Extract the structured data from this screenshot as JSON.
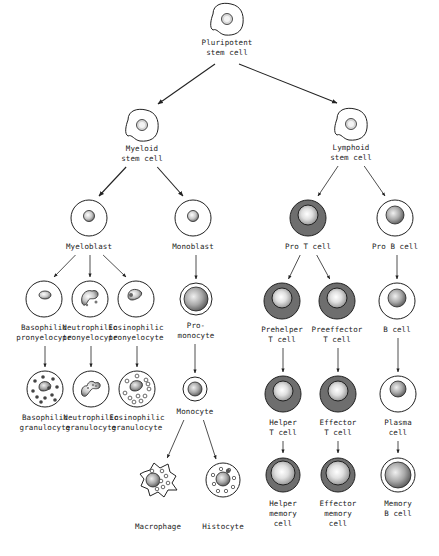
{
  "diagram": {
    "colors": {
      "line": "#222222",
      "t_cell_fill": "#6e6e6e",
      "nucleus_light": "#f4f4f4",
      "nucleus_dark": "#8a8a8a",
      "background": "#ffffff"
    },
    "nodes": [
      {
        "id": "pluripotent",
        "label": "Pluripotent\nstem cell",
        "x": 227,
        "y": 20,
        "type": "stem"
      },
      {
        "id": "myeloid_stem",
        "label": "Myeloid\nstem cell",
        "x": 142,
        "y": 126,
        "type": "stem"
      },
      {
        "id": "lymphoid_stem",
        "label": "Lymphoid\nstem cell",
        "x": 351,
        "y": 125,
        "type": "stem"
      },
      {
        "id": "myeloblast",
        "label": "Myeloblast",
        "x": 89,
        "y": 218,
        "type": "blast"
      },
      {
        "id": "monoblast",
        "label": "Monoblast",
        "x": 193,
        "y": 218,
        "type": "blast"
      },
      {
        "id": "pro_t",
        "label": "Pro T cell",
        "x": 308,
        "y": 218,
        "type": "t"
      },
      {
        "id": "pro_b",
        "label": "Pro B cell",
        "x": 395,
        "y": 218,
        "type": "b"
      },
      {
        "id": "baso_pro",
        "label": "Basophilic\npronyelocyte",
        "x": 44,
        "y": 299,
        "type": "baso_pro"
      },
      {
        "id": "neutro_pro",
        "label": "Neutrophilic\npronyelocyte",
        "x": 90,
        "y": 299,
        "type": "neutro_pro"
      },
      {
        "id": "eosino_pro",
        "label": "Eosinophilic\npronyelocyte",
        "x": 136,
        "y": 299,
        "type": "eosino_pro"
      },
      {
        "id": "promonocyte",
        "label": "Pro-\nmonocyte",
        "x": 196,
        "y": 299,
        "type": "promono"
      },
      {
        "id": "prehelper",
        "label": "Prehelper\nT cell",
        "x": 282,
        "y": 301,
        "type": "t"
      },
      {
        "id": "preeffector",
        "label": "Preeffector\nT cell",
        "x": 337,
        "y": 301,
        "type": "t"
      },
      {
        "id": "b_cell",
        "label": "B cell",
        "x": 397,
        "y": 301,
        "type": "b"
      },
      {
        "id": "baso_gran",
        "label": "Basophilic\ngranulocyte",
        "x": 45,
        "y": 389,
        "type": "baso_gran"
      },
      {
        "id": "neutro_gran",
        "label": "Neutrophilic\ngranulocyte",
        "x": 91,
        "y": 389,
        "type": "neutro_gran"
      },
      {
        "id": "eosino_gran",
        "label": "Eosinophilic\ngranulocyte",
        "x": 137,
        "y": 389,
        "type": "eosino_gran"
      },
      {
        "id": "monocyte",
        "label": "Monocyte",
        "x": 195,
        "y": 389,
        "type": "monocyte"
      },
      {
        "id": "helper_t",
        "label": "Helper\nT cell",
        "x": 283,
        "y": 394,
        "type": "t"
      },
      {
        "id": "effector_t",
        "label": "Effector\nT cell",
        "x": 338,
        "y": 394,
        "type": "t"
      },
      {
        "id": "plasma",
        "label": "Plasma\ncell",
        "x": 398,
        "y": 394,
        "type": "plasma"
      },
      {
        "id": "macrophage",
        "label": "Macrophage",
        "x": 158,
        "y": 480,
        "type": "macrophage"
      },
      {
        "id": "histocyte",
        "label": "Histocyte",
        "x": 223,
        "y": 480,
        "type": "histocyte"
      },
      {
        "id": "helper_mem",
        "label": "Helper\nmemory\ncell",
        "x": 283,
        "y": 475,
        "type": "t_mem"
      },
      {
        "id": "effector_mem",
        "label": "Effector\nmemory\ncell",
        "x": 338,
        "y": 475,
        "type": "t_mem"
      },
      {
        "id": "memory_b",
        "label": "Memory\nB cell",
        "x": 398,
        "y": 475,
        "type": "b_mem"
      }
    ],
    "edges": [
      [
        "pluripotent",
        "myeloid_stem"
      ],
      [
        "pluripotent",
        "lymphoid_stem"
      ],
      [
        "myeloid_stem",
        "myeloblast"
      ],
      [
        "myeloid_stem",
        "monoblast"
      ],
      [
        "lymphoid_stem",
        "pro_t"
      ],
      [
        "lymphoid_stem",
        "pro_b"
      ],
      [
        "myeloblast",
        "baso_pro"
      ],
      [
        "myeloblast",
        "neutro_pro"
      ],
      [
        "myeloblast",
        "eosino_pro"
      ],
      [
        "monoblast",
        "promonocyte"
      ],
      [
        "pro_t",
        "prehelper"
      ],
      [
        "pro_t",
        "preeffector"
      ],
      [
        "pro_b",
        "b_cell"
      ],
      [
        "baso_pro",
        "baso_gran"
      ],
      [
        "neutro_pro",
        "neutro_gran"
      ],
      [
        "eosino_pro",
        "eosino_gran"
      ],
      [
        "promonocyte",
        "monocyte"
      ],
      [
        "prehelper",
        "helper_t"
      ],
      [
        "preeffector",
        "effector_t"
      ],
      [
        "b_cell",
        "plasma"
      ],
      [
        "monocyte",
        "macrophage"
      ],
      [
        "monocyte",
        "histocyte"
      ],
      [
        "helper_t",
        "helper_mem"
      ],
      [
        "effector_t",
        "effector_mem"
      ],
      [
        "plasma",
        "memory_b"
      ]
    ]
  }
}
